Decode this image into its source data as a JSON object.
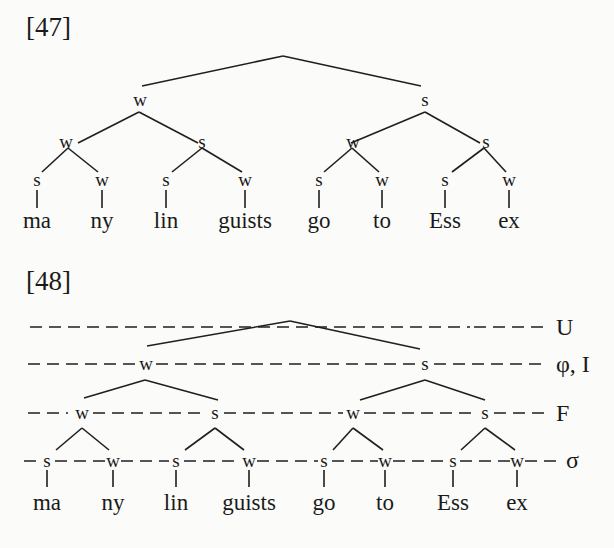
{
  "page": {
    "background": "#fbfbf9",
    "ink": "#1a1a1a"
  },
  "example_47": {
    "label": "[47]",
    "root": "",
    "level1": [
      "w",
      "s"
    ],
    "level2": [
      "w",
      "s",
      "w",
      "s"
    ],
    "level3": [
      "s",
      "w",
      "s",
      "w",
      "s",
      "w",
      "s",
      "w"
    ],
    "syllables": [
      "ma",
      "ny",
      "lin",
      "guists",
      "go",
      "to",
      "Ess",
      "ex"
    ]
  },
  "example_48": {
    "label": "[48]",
    "tiers": {
      "U": "U",
      "phi_I": "φ, I",
      "F": "F",
      "sigma": "σ"
    },
    "phrase_level": [
      "w",
      "s"
    ],
    "foot_level": [
      "w",
      "s",
      "w",
      "s"
    ],
    "syllable_level": [
      "s",
      "w",
      "s",
      "w",
      "s",
      "w",
      "s",
      "w"
    ],
    "syllables": [
      "ma",
      "ny",
      "lin",
      "guists",
      "go",
      "to",
      "Ess",
      "ex"
    ]
  }
}
